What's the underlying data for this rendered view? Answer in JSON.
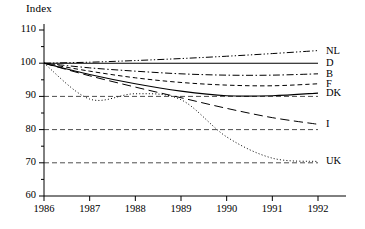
{
  "chart_data": {
    "type": "line",
    "title": "",
    "ylabel": "Index",
    "xlabel": "",
    "ylim": [
      60,
      110
    ],
    "xlim": [
      1986,
      1992
    ],
    "grid": "horizontal dashed at 70, 80, 90",
    "legend_position": "right-of-plot inline labels",
    "x": [
      1986,
      1987,
      1988,
      1989,
      1990,
      1991,
      1992
    ],
    "y_ticks": [
      60,
      70,
      80,
      90,
      100,
      110
    ],
    "x_ticks": [
      "1986",
      "1987",
      "1988",
      "1989",
      "1990",
      "1991",
      "1992"
    ],
    "gridlines": [
      70,
      80,
      90
    ],
    "series": [
      {
        "name": "NL",
        "label": "NL",
        "style": "dash-dot-dot",
        "values": [
          100,
          100.3,
          100.8,
          101.4,
          102.1,
          102.9,
          103.8
        ]
      },
      {
        "name": "D",
        "label": "D",
        "style": "solid",
        "values": [
          100,
          100,
          100,
          100,
          100,
          100,
          100
        ]
      },
      {
        "name": "B",
        "label": "B",
        "style": "dash-dot",
        "values": [
          100,
          98.6,
          97.6,
          96.8,
          96.4,
          96.4,
          96.8
        ]
      },
      {
        "name": "F",
        "label": "F",
        "style": "dashed",
        "values": [
          100,
          97.6,
          95.6,
          94.2,
          93.4,
          93.2,
          93.8
        ]
      },
      {
        "name": "DK",
        "label": "DK",
        "style": "solid",
        "values": [
          100,
          96.6,
          93.8,
          91.6,
          90.2,
          90.2,
          91.0
        ]
      },
      {
        "name": "I",
        "label": "I",
        "style": "long-dash",
        "values": [
          100,
          96.2,
          92.8,
          89.6,
          86.4,
          83.6,
          81.6
        ]
      },
      {
        "name": "UK",
        "label": "UK",
        "style": "dotted",
        "values": [
          100,
          89.2,
          90.8,
          89.0,
          77.8,
          71.4,
          70.4
        ]
      }
    ]
  }
}
